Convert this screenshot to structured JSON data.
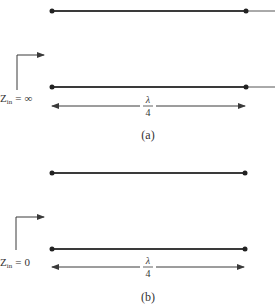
{
  "figure": {
    "panels": [
      {
        "id": "a",
        "caption": "(a)",
        "termination": "open circuit",
        "impedance_label": {
          "symbol": "Z",
          "subscript": "in",
          "relation": "=",
          "value": "∞"
        },
        "length_label": {
          "numerator": "λ",
          "denominator": "4"
        }
      },
      {
        "id": "b",
        "caption": "(b)",
        "termination": "short circuit",
        "impedance_label": {
          "symbol": "Z",
          "subscript": "in",
          "relation": "=",
          "value": "0"
        },
        "length_label": {
          "numerator": "λ",
          "denominator": "4"
        }
      }
    ]
  },
  "colors": {
    "line": "#3a3a3a",
    "text": "#333333",
    "background": "#ffffff"
  }
}
